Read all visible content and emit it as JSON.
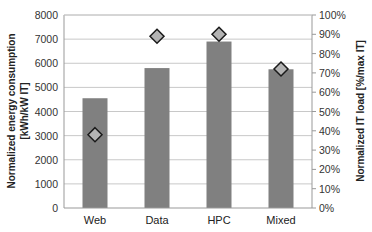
{
  "chart_data": {
    "type": "bar",
    "title": "",
    "categories": [
      "Web",
      "Data",
      "HPC",
      "Mixed"
    ],
    "series": [
      {
        "name": "Normalized energy consumption",
        "kind": "bar",
        "axis": "left",
        "color": "#808080",
        "values": [
          4550,
          5800,
          6900,
          5750
        ]
      },
      {
        "name": "Normalized IT load",
        "kind": "marker-diamond",
        "axis": "right",
        "color": "#b3b3b3",
        "values": [
          0.38,
          0.89,
          0.9,
          0.72
        ]
      }
    ],
    "ylabel": "Normalized energy consumption [kWh/kW IT]",
    "ylabel_line1": "Normalized energy consumption",
    "ylabel_line2": "[kWh/kW IT]",
    "y2label": "Normalized IT load [%/max IT]",
    "xlabel": "",
    "ylim": [
      0,
      8000
    ],
    "y2lim": [
      0,
      1
    ],
    "yticks": [
      "0",
      "1000",
      "2000",
      "3000",
      "4000",
      "5000",
      "6000",
      "7000",
      "8000"
    ],
    "y2ticks": [
      "0%",
      "10%",
      "20%",
      "30%",
      "40%",
      "50%",
      "60%",
      "70%",
      "80%",
      "90%",
      "100%"
    ],
    "grid": true,
    "legend": "none"
  }
}
